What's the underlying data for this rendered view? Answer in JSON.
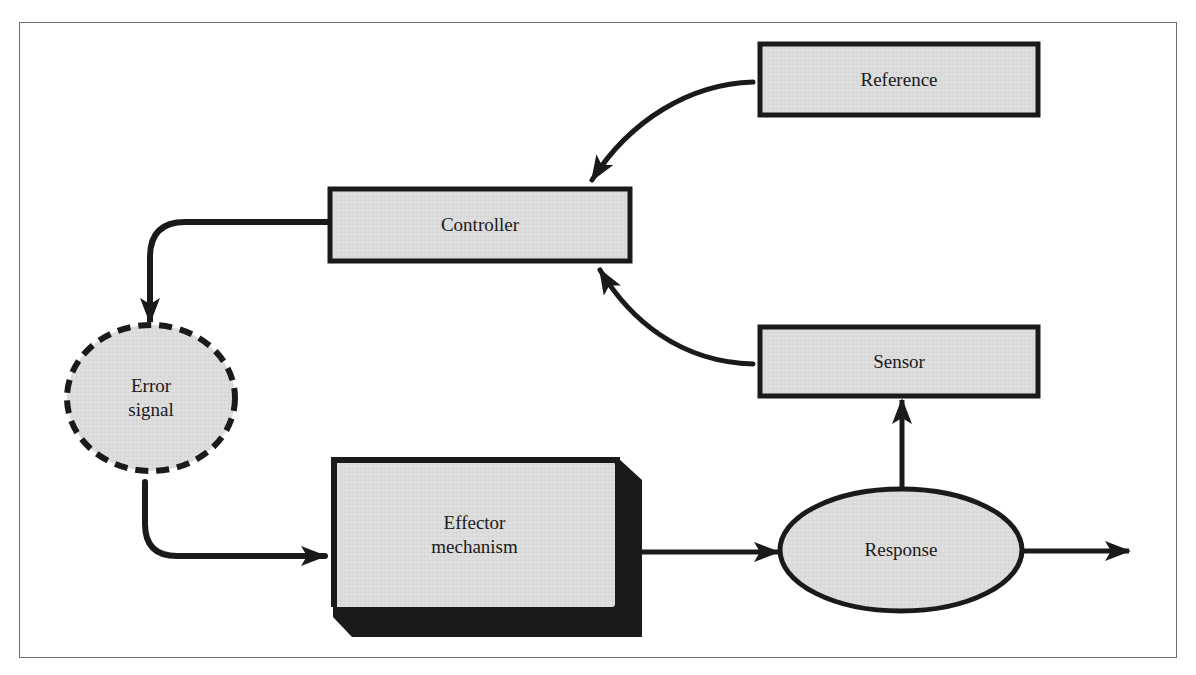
{
  "diagram": {
    "type": "feedback-control-loop",
    "nodes": {
      "reference": {
        "label": "Reference",
        "shape": "rectangle"
      },
      "controller": {
        "label": "Controller",
        "shape": "rectangle"
      },
      "sensor": {
        "label": "Sensor",
        "shape": "rectangle"
      },
      "error_signal": {
        "line1": "Error",
        "line2": "signal",
        "shape": "dashed-ellipse"
      },
      "effector": {
        "line1": "Effector",
        "line2": "mechanism",
        "shape": "3d-block"
      },
      "response": {
        "label": "Response",
        "shape": "ellipse"
      }
    },
    "edges": [
      {
        "from": "Reference",
        "to": "Controller"
      },
      {
        "from": "Sensor",
        "to": "Controller"
      },
      {
        "from": "Controller",
        "to": "Error signal"
      },
      {
        "from": "Error signal",
        "to": "Effector mechanism"
      },
      {
        "from": "Effector mechanism",
        "to": "Response"
      },
      {
        "from": "Response",
        "to": "Sensor"
      },
      {
        "from": "Response",
        "to": "output"
      }
    ],
    "colors": {
      "fill": "#dcdcdc",
      "stroke": "#1a1a1a",
      "frame": "#6e6e6e",
      "background": "#ffffff"
    }
  }
}
